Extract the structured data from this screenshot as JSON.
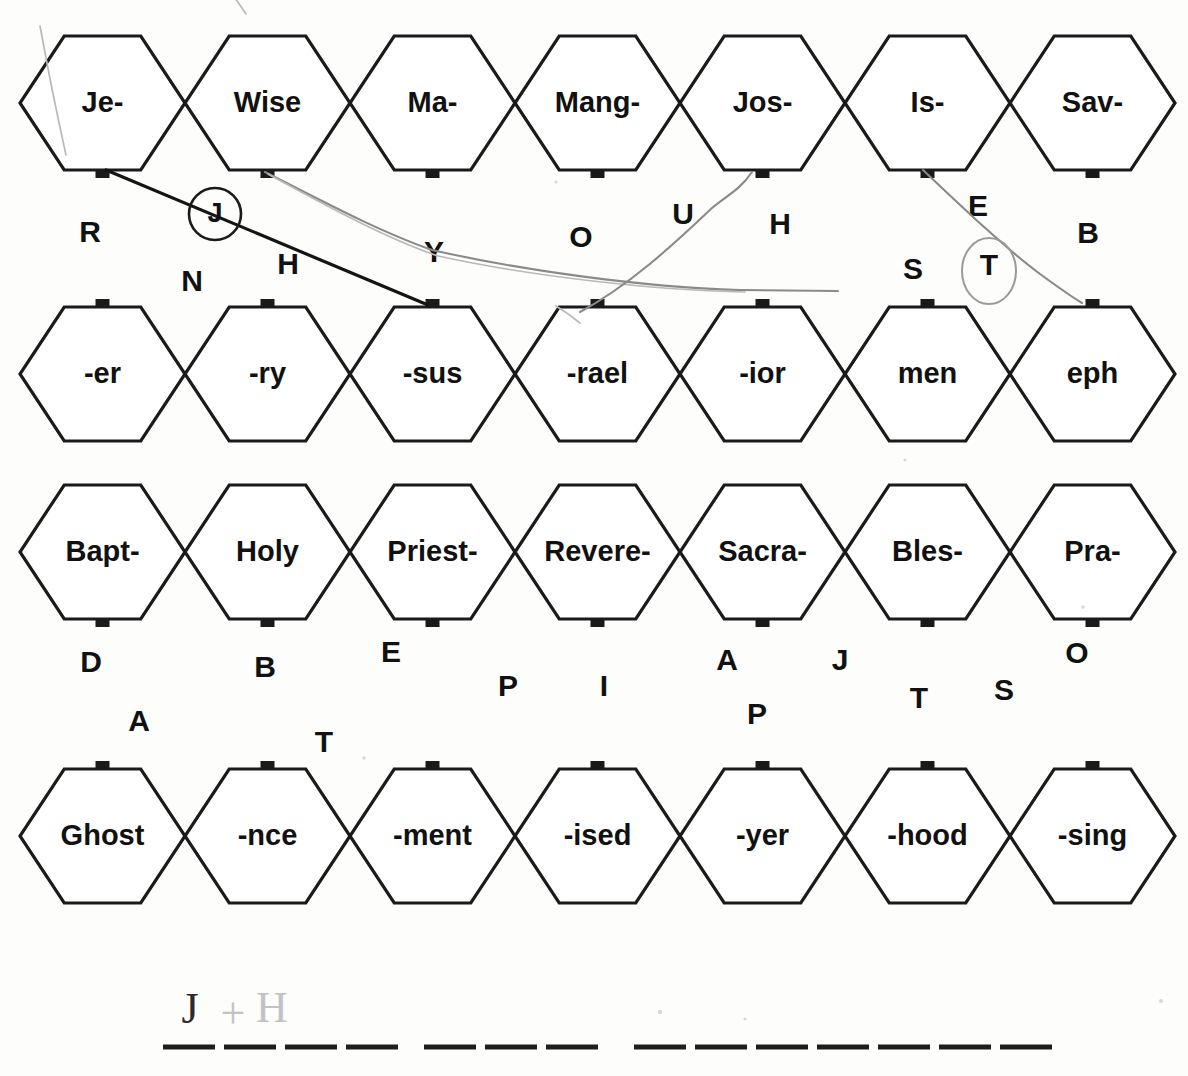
{
  "worksheet": {
    "title": "Hexagon word-part matching puzzle",
    "background_color": "#fdfdfc",
    "ink_color": "#1a1a1a"
  },
  "geometry": {
    "hex_width": 165,
    "hex_height": 134,
    "hex_left_start": 20,
    "hex_step": 165,
    "row_tops": [
      36,
      307,
      485,
      769
    ]
  },
  "rows": [
    {
      "name": "row-1-prefixes",
      "top": 36,
      "cells": [
        {
          "label": "Je-",
          "tab": "bottom"
        },
        {
          "label": "Wise",
          "tab": "bottom"
        },
        {
          "label": "Ma-",
          "tab": "bottom"
        },
        {
          "label": "Mang-",
          "tab": "bottom"
        },
        {
          "label": "Jos-",
          "tab": "bottom"
        },
        {
          "label": "Is-",
          "tab": "bottom"
        },
        {
          "label": "Sav-",
          "tab": "bottom"
        }
      ]
    },
    {
      "name": "row-2-suffixes",
      "top": 307,
      "cells": [
        {
          "label": "-er",
          "tab": "top"
        },
        {
          "label": "-ry",
          "tab": "top"
        },
        {
          "label": "-sus",
          "tab": "top"
        },
        {
          "label": "-rael",
          "tab": "top"
        },
        {
          "label": "-ior",
          "tab": "top"
        },
        {
          "label": "men",
          "tab": "top"
        },
        {
          "label": "eph",
          "tab": "top"
        }
      ]
    },
    {
      "name": "row-3-prefixes",
      "top": 485,
      "cells": [
        {
          "label": "Bapt-",
          "tab": "bottom"
        },
        {
          "label": "Holy",
          "tab": "bottom"
        },
        {
          "label": "Priest-",
          "tab": "bottom"
        },
        {
          "label": "Revere-",
          "tab": "bottom"
        },
        {
          "label": "Sacra-",
          "tab": "bottom"
        },
        {
          "label": "Bles-",
          "tab": "bottom"
        },
        {
          "label": "Pra-",
          "tab": "bottom"
        }
      ]
    },
    {
      "name": "row-4-suffixes",
      "top": 769,
      "cells": [
        {
          "label": "Ghost",
          "tab": "top"
        },
        {
          "label": "-nce",
          "tab": "top"
        },
        {
          "label": "-ment",
          "tab": "top"
        },
        {
          "label": "-ised",
          "tab": "top"
        },
        {
          "label": "-yer",
          "tab": "top"
        },
        {
          "label": "-hood",
          "tab": "top"
        },
        {
          "label": "-sing",
          "tab": "top"
        }
      ]
    }
  ],
  "floating_letters": {
    "gap_upper": [
      {
        "letter": "R",
        "x": 90,
        "y": 234
      },
      {
        "letter": "N",
        "x": 192,
        "y": 283
      },
      {
        "letter": "H",
        "x": 288,
        "y": 266
      },
      {
        "letter": "Y",
        "x": 434,
        "y": 254
      },
      {
        "letter": "O",
        "x": 581,
        "y": 239
      },
      {
        "letter": "U",
        "x": 683,
        "y": 216
      },
      {
        "letter": "H",
        "x": 780,
        "y": 226
      },
      {
        "letter": "E",
        "x": 978,
        "y": 208
      },
      {
        "letter": "B",
        "x": 1088,
        "y": 235
      },
      {
        "letter": "S",
        "x": 913,
        "y": 271
      },
      {
        "letter": "T",
        "x": 989,
        "y": 267
      }
    ],
    "gap_lower": [
      {
        "letter": "D",
        "x": 91,
        "y": 664
      },
      {
        "letter": "A",
        "x": 139,
        "y": 723
      },
      {
        "letter": "B",
        "x": 265,
        "y": 669
      },
      {
        "letter": "T",
        "x": 324,
        "y": 744
      },
      {
        "letter": "E",
        "x": 391,
        "y": 654
      },
      {
        "letter": "P",
        "x": 508,
        "y": 688
      },
      {
        "letter": "I",
        "x": 604,
        "y": 688
      },
      {
        "letter": "A",
        "x": 727,
        "y": 662
      },
      {
        "letter": "P",
        "x": 757,
        "y": 716
      },
      {
        "letter": "J",
        "x": 840,
        "y": 662
      },
      {
        "letter": "T",
        "x": 919,
        "y": 700
      },
      {
        "letter": "S",
        "x": 1004,
        "y": 692
      },
      {
        "letter": "O",
        "x": 1077,
        "y": 655
      }
    ]
  },
  "answer_blanks": {
    "y": 1047,
    "groups": [
      {
        "name": "group-1",
        "count": 4,
        "start_x": 163,
        "blank_width": 52,
        "gap": 9
      },
      {
        "name": "group-2",
        "count": 3,
        "start_x": 424,
        "blank_width": 52,
        "gap": 9
      },
      {
        "name": "group-3",
        "count": 7,
        "start_x": 634,
        "blank_width": 52,
        "gap": 9
      }
    ]
  },
  "handwriting": [
    {
      "text": "J",
      "x": 190,
      "y": 1013,
      "faint": false
    },
    {
      "text": "+",
      "x": 233,
      "y": 1018,
      "faint": true
    },
    {
      "text": "H",
      "x": 272,
      "y": 1012,
      "faint": true
    }
  ],
  "pen_marks": {
    "solid_line_je_to_sus": "Je- bottom tab to -sus top tab",
    "gray_line_wise_to_rael": "Wise bottom tab to -rael top tab",
    "gray_line_jos_down_left": "Jos- bottom tab curving down-left to -rael area",
    "gray_line_is_to_eph": "Is- bottom tab to eph top tab",
    "circled_letters": [
      "J",
      "T"
    ]
  }
}
